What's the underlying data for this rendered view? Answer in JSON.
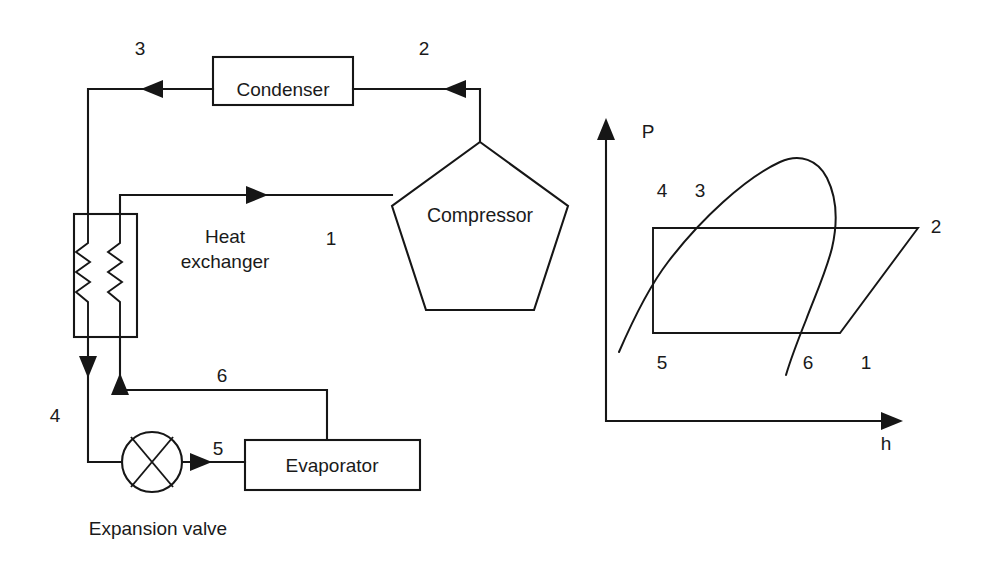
{
  "figure": {
    "type": "process-flow-diagram"
  },
  "flow_diagram": {
    "components": {
      "condenser": {
        "label": "Condenser"
      },
      "compressor": {
        "label": "Compressor"
      },
      "heat_exchanger": {
        "label_line1": "Heat",
        "label_line2": "exchanger"
      },
      "evaporator": {
        "label": "Evaporator"
      },
      "expansion_valve": {
        "label": "Expansion valve"
      }
    },
    "state_points": [
      {
        "id": "1",
        "label": "1"
      },
      {
        "id": "2",
        "label": "2"
      },
      {
        "id": "3",
        "label": "3"
      },
      {
        "id": "4",
        "label": "4"
      },
      {
        "id": "5",
        "label": "5"
      },
      {
        "id": "6",
        "label": "6"
      }
    ]
  },
  "ph_diagram": {
    "axes": {
      "y_label": "P",
      "x_label": "h"
    },
    "state_points": [
      {
        "id": "1",
        "label": "1"
      },
      {
        "id": "2",
        "label": "2"
      },
      {
        "id": "3",
        "label": "3"
      },
      {
        "id": "4",
        "label": "4"
      },
      {
        "id": "5",
        "label": "5"
      },
      {
        "id": "6",
        "label": "6"
      }
    ],
    "elements": {
      "saturation_dome": "vapour-dome-curve",
      "cycle_path": "closed-cycle-polygon"
    }
  },
  "colors": {
    "line": "#161616",
    "background": "#ffffff",
    "text": "#1a1a1a"
  }
}
